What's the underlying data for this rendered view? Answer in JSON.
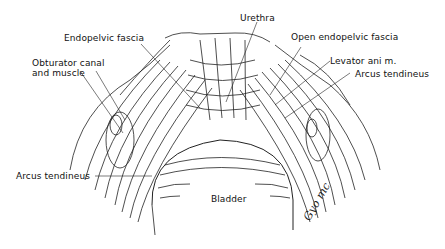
{
  "figure": {
    "type": "anatomical line drawing",
    "labels": {
      "urethra": "Urethra",
      "endopelvic_fascia": "Endopelvic fascia",
      "open_endopelvic_fascia": "Open endopelvic fascia",
      "obturator_line1": "Obturator canal",
      "obturator_line2": "and muscle",
      "levator_ani": "Levator ani m.",
      "arcus_tendineus_right": "Arcus tendineus",
      "arcus_tendineus_left": "Arcus tendineus",
      "bladder": "Bladder"
    },
    "signature": "Gyo mc"
  }
}
